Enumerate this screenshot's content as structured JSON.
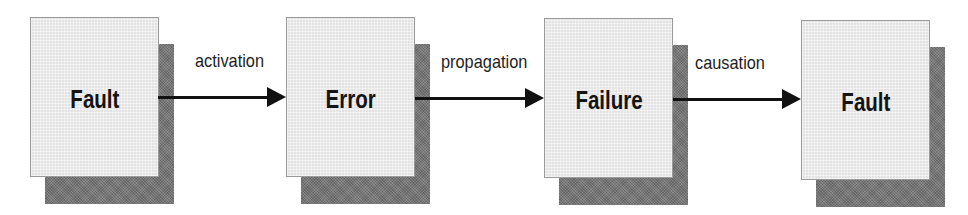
{
  "diagram": {
    "nodes": [
      {
        "id": "fault-1",
        "label": "Fault"
      },
      {
        "id": "error",
        "label": "Error"
      },
      {
        "id": "failure",
        "label": "Failure"
      },
      {
        "id": "fault-2",
        "label": "Fault"
      }
    ],
    "edges": [
      {
        "from": "fault-1",
        "to": "error",
        "label": "activation"
      },
      {
        "from": "error",
        "to": "failure",
        "label": "propagation"
      },
      {
        "from": "failure",
        "to": "fault-2",
        "label": "causation"
      }
    ]
  },
  "colors": {
    "box_fill": "#ececec",
    "box_border": "#9a9a9a",
    "shadow": "#7b7b7b",
    "arrow": "#111111",
    "text": "#141414"
  }
}
